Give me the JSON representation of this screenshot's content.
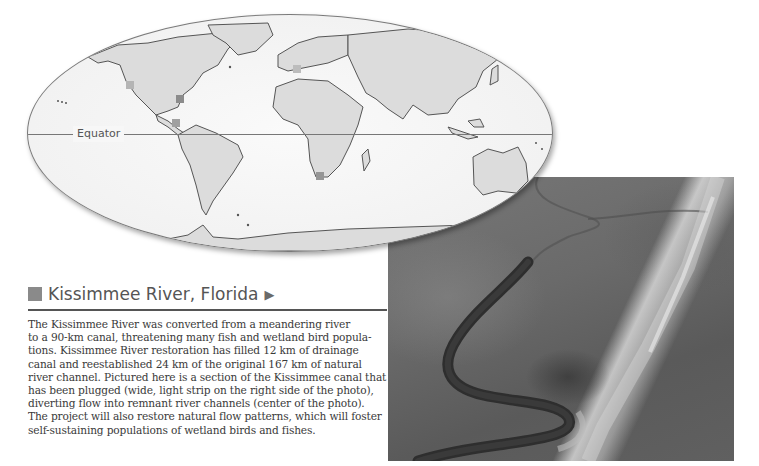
{
  "map": {
    "equator_label": "Equator",
    "markers": [
      {
        "name": "california-marker",
        "x": 103,
        "y": 66,
        "color": "#b5b5b5"
      },
      {
        "name": "florida-marker",
        "x": 148,
        "y": 80,
        "color": "#8c8c8c"
      },
      {
        "name": "central-america-marker",
        "x": 144,
        "y": 105,
        "color": "#a0a0a0"
      },
      {
        "name": "europe-marker",
        "x": 265,
        "y": 52,
        "color": "#bcbcbc"
      },
      {
        "name": "south-africa-marker",
        "x": 288,
        "y": 158,
        "color": "#959595"
      }
    ],
    "colors": {
      "ocean": "#f4f4f4",
      "land": "#dcdcdc",
      "outline": "#555555"
    }
  },
  "photo": {
    "subject": "aerial-river-photo",
    "description": "Kissimmee River aerial view"
  },
  "section": {
    "title": "Kissimmee River, Florida",
    "arrow": "▶",
    "lines": [
      "The Kissimmee River was converted from a meandering river",
      "to a 90-km canal, threatening many fish and wetland bird popula-",
      "tions. Kissimmee River restoration has filled 12 km of drainage",
      "canal and reestablished 24 km of the original 167 km of natural",
      "river channel. Pictured here is a section of the Kissimmee canal that",
      "has been plugged (wide, light strip on the right side of the photo),",
      "diverting flow into remnant river channels (center of the photo).",
      "The project will also restore natural flow patterns, which will foster",
      "self-sustaining populations of wetland birds and fishes."
    ]
  }
}
